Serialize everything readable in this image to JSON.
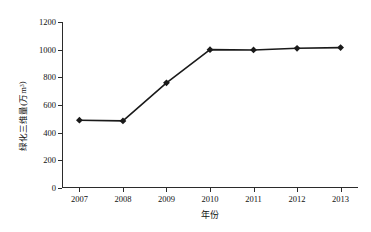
{
  "chart_data": {
    "type": "line",
    "title": "",
    "xlabel": "年份",
    "ylabel": "绿化三维量(万m³)",
    "ylabel_main": "绿化三维量(万m",
    "ylabel_sup": "3",
    "ylabel_close": ")",
    "categories": [
      "2007",
      "2008",
      "2009",
      "2010",
      "2011",
      "2012",
      "2013"
    ],
    "x": [
      2007,
      2008,
      2009,
      2010,
      2011,
      2012,
      2013
    ],
    "values": [
      490,
      485,
      760,
      1000,
      998,
      1010,
      1015
    ],
    "series": [
      {
        "name": "绿化三维量",
        "values": [
          490,
          485,
          760,
          1000,
          998,
          1010,
          1015
        ]
      }
    ],
    "ylim": [
      0,
      1200
    ],
    "xlim": [
      2006.6,
      2013.4
    ],
    "ytick_labels": [
      "0",
      "200",
      "400",
      "600",
      "800",
      "1000",
      "1200"
    ],
    "ytick_values": [
      0,
      200,
      400,
      600,
      800,
      1000,
      1200
    ],
    "xtick_labels": [
      "2007",
      "2008",
      "2009",
      "2010",
      "2011",
      "2012",
      "2013"
    ],
    "grid": false,
    "legend": false,
    "legend_position": "none",
    "marker": "diamond",
    "line_color": "#1a1a1a",
    "marker_color": "#1a1a1a",
    "background_color": "#ffffff",
    "axis_color": "#2b2b2b"
  }
}
